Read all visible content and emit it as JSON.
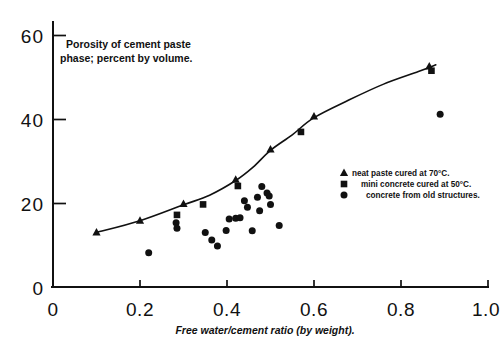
{
  "chart_data": {
    "type": "scatter",
    "title": "Porosity of cement paste phase; percent by volume.",
    "title_lines": [
      "Porosity of cement paste",
      "phase; percent by volume."
    ],
    "xlabel": "Free water/cement ratio (by weight).",
    "ylabel": "Porosity of cement paste phase; percent by volume.",
    "xlim": [
      0,
      1.0
    ],
    "ylim": [
      0,
      62
    ],
    "xticks": [
      0,
      0.2,
      0.4,
      0.6,
      0.8,
      1.0
    ],
    "xtick_labels": [
      "0",
      "0.2",
      "0.4",
      "0.6",
      "0.8",
      "1.0"
    ],
    "yticks": [
      0,
      20,
      40,
      60
    ],
    "ytick_labels": [
      "0",
      "20",
      "40",
      "60"
    ],
    "grid": false,
    "legend_position": "center-right",
    "series": [
      {
        "name": "neat paste cured at 70°C.",
        "marker": "triangle",
        "color": "#111111",
        "points": [
          {
            "x": 0.1,
            "y": 13.0
          },
          {
            "x": 0.2,
            "y": 15.8
          },
          {
            "x": 0.3,
            "y": 19.8
          },
          {
            "x": 0.42,
            "y": 25.6
          },
          {
            "x": 0.5,
            "y": 32.8
          },
          {
            "x": 0.6,
            "y": 40.7
          },
          {
            "x": 0.865,
            "y": 52.6
          }
        ]
      },
      {
        "name": "mini concrete cured at 50°C.",
        "marker": "square",
        "color": "#111111",
        "points": [
          {
            "x": 0.285,
            "y": 17.2
          },
          {
            "x": 0.345,
            "y": 19.7
          },
          {
            "x": 0.425,
            "y": 24.1
          },
          {
            "x": 0.57,
            "y": 37.0
          },
          {
            "x": 0.87,
            "y": 51.6
          }
        ]
      },
      {
        "name": "concrete from old structures.",
        "marker": "circle",
        "color": "#111111",
        "points": [
          {
            "x": 0.22,
            "y": 8.2
          },
          {
            "x": 0.283,
            "y": 15.3
          },
          {
            "x": 0.285,
            "y": 14.0
          },
          {
            "x": 0.35,
            "y": 13.0
          },
          {
            "x": 0.365,
            "y": 11.2
          },
          {
            "x": 0.378,
            "y": 9.8
          },
          {
            "x": 0.398,
            "y": 13.5
          },
          {
            "x": 0.405,
            "y": 16.2
          },
          {
            "x": 0.42,
            "y": 16.4
          },
          {
            "x": 0.43,
            "y": 16.5
          },
          {
            "x": 0.44,
            "y": 20.6
          },
          {
            "x": 0.447,
            "y": 19.0
          },
          {
            "x": 0.458,
            "y": 13.4
          },
          {
            "x": 0.47,
            "y": 21.4
          },
          {
            "x": 0.475,
            "y": 18.2
          },
          {
            "x": 0.48,
            "y": 24.0
          },
          {
            "x": 0.492,
            "y": 22.4
          },
          {
            "x": 0.497,
            "y": 21.7
          },
          {
            "x": 0.5,
            "y": 19.7
          },
          {
            "x": 0.52,
            "y": 14.7
          },
          {
            "x": 0.89,
            "y": 41.2
          }
        ]
      }
    ],
    "trend_curve": {
      "description": "smooth rising curve through neat paste series",
      "points": [
        {
          "x": 0.1,
          "y": 13.0
        },
        {
          "x": 0.2,
          "y": 15.8
        },
        {
          "x": 0.3,
          "y": 19.6
        },
        {
          "x": 0.36,
          "y": 21.9
        },
        {
          "x": 0.42,
          "y": 25.4
        },
        {
          "x": 0.46,
          "y": 28.6
        },
        {
          "x": 0.5,
          "y": 32.6
        },
        {
          "x": 0.55,
          "y": 36.3
        },
        {
          "x": 0.6,
          "y": 40.4
        },
        {
          "x": 0.68,
          "y": 44.6
        },
        {
          "x": 0.76,
          "y": 48.4
        },
        {
          "x": 0.84,
          "y": 51.4
        },
        {
          "x": 0.88,
          "y": 53.0
        }
      ]
    }
  },
  "legend": {
    "entries": [
      {
        "marker": "triangle",
        "label": "neat paste cured at 70°C."
      },
      {
        "marker": "square",
        "label": "mini concrete cured at 50°C."
      },
      {
        "marker": "circle",
        "label": "concrete from old structures."
      }
    ]
  }
}
